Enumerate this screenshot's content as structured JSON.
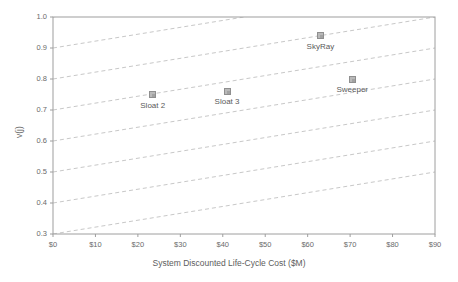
{
  "chart_data": {
    "type": "scatter",
    "title": "",
    "xlabel": "System Discounted Life-Cycle Cost ($M)",
    "ylabel": "v(j)",
    "xlim": [
      0,
      90
    ],
    "ylim": [
      0.3,
      1.0
    ],
    "xticks": [
      0,
      10,
      20,
      30,
      40,
      50,
      60,
      70,
      80,
      90
    ],
    "xtick_labels": [
      "$0",
      "$10",
      "$20",
      "$30",
      "$40",
      "$50",
      "$60",
      "$70",
      "$80",
      "$90"
    ],
    "yticks": [
      0.3,
      0.4,
      0.5,
      0.6,
      0.7,
      0.8,
      0.9,
      1.0
    ],
    "ytick_labels": [
      "0.3",
      "0.4",
      "0.5",
      "0.6",
      "0.7",
      "0.8",
      "0.9",
      "1.0"
    ],
    "grid": false,
    "legend": "none",
    "points": [
      {
        "label": "Sloat 2",
        "x": 23.5,
        "y": 0.75
      },
      {
        "label": "Sloat 3",
        "x": 41.0,
        "y": 0.76
      },
      {
        "label": "SkyRay",
        "x": 63.0,
        "y": 0.94
      },
      {
        "label": "Sweeper",
        "x": 70.5,
        "y": 0.8
      }
    ],
    "iso_lines": {
      "description": "parallel dashed iso-preference lines, slope +0.2 v(j) per $90M",
      "slope_per_dollar_m": 0.002222,
      "intercepts": [
        0.3,
        0.4,
        0.5,
        0.6,
        0.7,
        0.8,
        0.9,
        1.0,
        1.1
      ],
      "style": "dashed",
      "color": "#c8c8c8"
    },
    "colors": {
      "marker_fill": "#b9b9b9",
      "marker_edge": "#8f8f8f",
      "axis": "#9a9a9a",
      "text": "#5d5d5d",
      "iso_line": "#c8c8c8",
      "background": "#ffffff"
    }
  }
}
